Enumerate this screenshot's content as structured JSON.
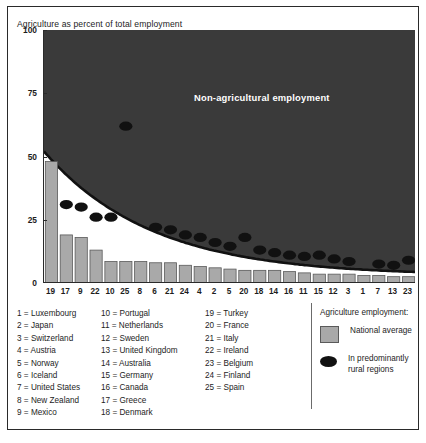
{
  "title": "Agriculture as percent of total employment",
  "overlay_label": "Non-agricultural employment",
  "legend": {
    "heading": "Agriculture employment:",
    "bar_label": "National average",
    "dot_label": "In predominantly rural regions"
  },
  "colors": {
    "bar_fill": "#a9a9a9",
    "bar_stroke": "#5a5a5a",
    "dot_fill": "#111111",
    "area_fill": "#3a3a3a",
    "axis": "#2a2a2a",
    "text": "#1d1d1d",
    "overlay_text": "#ffffff"
  },
  "key_columns": [
    [
      "1 = Luxembourg",
      "2 = Japan",
      "3 = Switzerland",
      "4 = Austria",
      "5 = Norway",
      "6 = Iceland",
      "7 = United States",
      "8 = New Zealand",
      "9 = Mexico"
    ],
    [
      "10 = Portugal",
      "11 = Netherlands",
      "12 = Sweden",
      "13 = United Kingdom",
      "14 = Australia",
      "15 = Germany",
      "16 = Canada",
      "17 = Greece",
      "18 = Denmark"
    ],
    [
      "19 = Turkey",
      "20 = France",
      "21 = Italy",
      "22 = Ireland",
      "23 = Belgium",
      "24 = Finland",
      "25 = Spain"
    ]
  ],
  "chart_data": {
    "type": "bar",
    "title": "Agriculture as percent of total employment",
    "xlabel": "",
    "ylabel": "Agriculture as percent of total employment",
    "ylim": [
      0,
      100
    ],
    "yticks": [
      0,
      25,
      50,
      75,
      100
    ],
    "grid": false,
    "legend_position": "right-outside",
    "categories": [
      "19",
      "17",
      "9",
      "22",
      "10",
      "25",
      "8",
      "6",
      "21",
      "24",
      "4",
      "2",
      "5",
      "20",
      "18",
      "14",
      "16",
      "11",
      "15",
      "12",
      "3",
      "1",
      "7",
      "13",
      "23"
    ],
    "category_names": [
      "Turkey",
      "Greece",
      "Mexico",
      "Ireland",
      "Portugal",
      "Spain",
      "New Zealand",
      "Iceland",
      "Italy",
      "Finland",
      "Austria",
      "Japan",
      "Norway",
      "France",
      "Denmark",
      "Australia",
      "Canada",
      "Netherlands",
      "Germany",
      "Sweden",
      "Switzerland",
      "Luxembourg",
      "United States",
      "United Kingdom",
      "Belgium"
    ],
    "series": [
      {
        "name": "National average",
        "type": "bar",
        "values": [
          48,
          19,
          18,
          13,
          8.5,
          8.5,
          8.5,
          8,
          8,
          7,
          6.5,
          6,
          5.5,
          5,
          5,
          5,
          4.5,
          4,
          3.5,
          3.5,
          3.5,
          3,
          3,
          2.5,
          2.5
        ]
      },
      {
        "name": "In predominantly rural regions",
        "type": "scatter",
        "values": [
          null,
          31,
          30,
          26,
          26,
          62,
          null,
          22,
          21,
          19,
          18,
          16,
          14.5,
          18,
          13,
          12,
          11,
          10.5,
          11,
          9.5,
          8.5,
          null,
          7.5,
          7,
          9
        ]
      }
    ],
    "annotation": {
      "text": "Non-agricultural employment",
      "region": "upper area above the agriculture curve"
    },
    "curve_note": "Dark filled region bounded below by a decaying curve from about 52% at the left edge to about 3% at the right edge; the region above the curve is shaded dark and labelled 'Non-agricultural employment'."
  }
}
